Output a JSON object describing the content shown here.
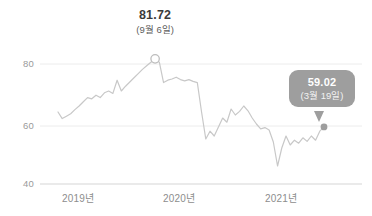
{
  "chart_data": {
    "type": "line",
    "title": "",
    "xlabel": "",
    "ylabel": "",
    "ylim": [
      40,
      85
    ],
    "yticks": [
      40,
      60,
      80
    ],
    "ytick_labels": [
      "40",
      "60",
      "80"
    ],
    "xticks": [
      "2019년",
      "2020년",
      "2021년"
    ],
    "grid": true,
    "legend": "none",
    "line_color": "#c8c8c8",
    "series": [
      {
        "name": "지수",
        "values": [
          64.0,
          61.8,
          62.6,
          63.4,
          64.8,
          66.0,
          67.4,
          68.8,
          68.4,
          69.6,
          68.8,
          70.4,
          71.0,
          70.2,
          74.6,
          71.0,
          72.6,
          74.0,
          75.4,
          76.8,
          78.2,
          79.4,
          80.6,
          81.72,
          80.6,
          73.8,
          74.6,
          75.0,
          75.6,
          74.8,
          74.4,
          74.8,
          74.2,
          73.8,
          64.0,
          55.0,
          57.6,
          56.0,
          59.0,
          62.0,
          60.6,
          65.0,
          63.0,
          64.2,
          66.0,
          64.4,
          62.0,
          60.0,
          58.4,
          58.8,
          58.0,
          54.0,
          46.0,
          52.0,
          56.0,
          53.0,
          54.6,
          53.6,
          55.4,
          54.2,
          56.0,
          54.6,
          57.6,
          59.02
        ]
      }
    ],
    "annotations": [
      {
        "name": "peak-annotation",
        "value": "81.72",
        "date": "(9월 6일)",
        "marker": "open-circle"
      },
      {
        "name": "end-tooltip",
        "value": "59.02",
        "date": "(3월 19일)",
        "marker": "filled-dot"
      }
    ]
  },
  "axes": {
    "y_labels": [
      "80",
      "60",
      "40"
    ],
    "x_labels": [
      "2019년",
      "2020년",
      "2021년"
    ]
  },
  "peak_label": {
    "value": "81.72",
    "date": "(9월 6일)"
  },
  "tooltip": {
    "value": "59.02",
    "date": "(3월 19일)"
  },
  "colors": {
    "line": "#c8c8c8",
    "grid": "#ebebeb",
    "tooltip_bg": "#9e9e9e",
    "text": "#3b3b3b",
    "tick": "#9a9a9a"
  }
}
